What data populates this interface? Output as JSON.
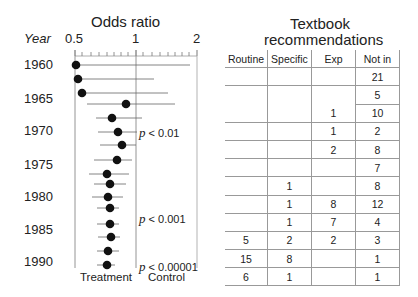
{
  "forest": {
    "title": "Odds ratio",
    "year_header": "Year",
    "axis_ticks": [
      "0.5",
      "1",
      "2"
    ],
    "year_labels": [
      "1960",
      "1965",
      "1970",
      "1975",
      "1980",
      "1985",
      "1990"
    ],
    "pvalues": [
      "p < 0.01",
      "p < 0.001",
      "p < 0.00001"
    ],
    "footer_left": "Treatment",
    "footer_right": "Control"
  },
  "table": {
    "title_line1": "Textbook",
    "title_line2": "recommendations",
    "columns": [
      "Routine",
      "Specific",
      "Exp",
      "Not in"
    ],
    "rows": [
      [
        "",
        "",
        "",
        "21"
      ],
      [
        "",
        "",
        "",
        "5"
      ],
      [
        "",
        "",
        "1",
        "10"
      ],
      [
        "",
        "",
        "1",
        "2"
      ],
      [
        "",
        "",
        "2",
        "8"
      ],
      [
        "",
        "",
        "",
        "7"
      ],
      [
        "",
        "1",
        "",
        "8"
      ],
      [
        "",
        "1",
        "8",
        "12"
      ],
      [
        "",
        "1",
        "7",
        "4"
      ],
      [
        "5",
        "2",
        "2",
        "3"
      ],
      [
        "15",
        "8",
        "",
        "1"
      ],
      [
        "6",
        "1",
        "",
        "1"
      ]
    ]
  },
  "chart_data": [
    {
      "type": "scatter",
      "title": "Odds ratio",
      "subtype": "forest plot (cumulative meta-analysis), log x-axis",
      "xlabel": "Odds ratio",
      "ylabel": "Year",
      "x_scale": "log",
      "xlim": [
        0.5,
        2
      ],
      "x_ticks": [
        0.5,
        1,
        2
      ],
      "y_tick_labels": [
        "1960",
        "1965",
        "1970",
        "1975",
        "1980",
        "1985",
        "1990"
      ],
      "reference_line": 1,
      "x_direction_labels": {
        "left": "Treatment",
        "right": "Control"
      },
      "annotations": [
        "p < 0.01",
        "p < 0.001",
        "p < 0.00001"
      ],
      "points": [
        {
          "row": 1,
          "or": 0.5,
          "ci_low": 0.5,
          "ci_high": 1.85
        },
        {
          "row": 2,
          "or": 0.51,
          "ci_low": 0.5,
          "ci_high": 1.24
        },
        {
          "row": 3,
          "or": 0.53,
          "ci_low": 0.5,
          "ci_high": 1.45
        },
        {
          "row": 4,
          "or": 0.89,
          "ci_low": 0.57,
          "ci_high": 1.55
        },
        {
          "row": 5,
          "or": 0.76,
          "ci_low": 0.64,
          "ci_high": 1.07
        },
        {
          "row": 6,
          "or": 0.81,
          "ci_low": 0.66,
          "ci_high": 1.03
        },
        {
          "row": 7,
          "or": 0.84,
          "ci_low": 0.68,
          "ci_high": 1.01
        },
        {
          "row": 8,
          "or": 0.8,
          "ci_low": 0.62,
          "ci_high": 0.96
        },
        {
          "row": 9,
          "or": 0.72,
          "ci_low": 0.59,
          "ci_high": 0.92
        },
        {
          "row": 10,
          "or": 0.74,
          "ci_low": 0.62,
          "ci_high": 0.89
        },
        {
          "row": 11,
          "or": 0.73,
          "ci_low": 0.61,
          "ci_high": 0.87
        },
        {
          "row": 12,
          "or": 0.74,
          "ci_low": 0.65,
          "ci_high": 0.84
        },
        {
          "row": 13,
          "or": 0.74,
          "ci_low": 0.65,
          "ci_high": 0.84
        },
        {
          "row": 14,
          "or": 0.75,
          "ci_low": 0.66,
          "ci_high": 0.85
        },
        {
          "row": 15,
          "or": 0.73,
          "ci_low": 0.65,
          "ci_high": 0.84
        },
        {
          "row": 16,
          "or": 0.72,
          "ci_low": 0.65,
          "ci_high": 0.81
        }
      ]
    },
    {
      "type": "table",
      "title": "Textbook recommendations",
      "columns": [
        "Routine",
        "Specific",
        "Exp",
        "Not in"
      ],
      "rows": [
        [
          null,
          null,
          null,
          21
        ],
        [
          null,
          null,
          null,
          5
        ],
        [
          null,
          null,
          1,
          10
        ],
        [
          null,
          null,
          1,
          2
        ],
        [
          null,
          null,
          2,
          8
        ],
        [
          null,
          null,
          null,
          7
        ],
        [
          null,
          1,
          null,
          8
        ],
        [
          null,
          1,
          8,
          12
        ],
        [
          null,
          1,
          7,
          4
        ],
        [
          5,
          2,
          2,
          3
        ],
        [
          15,
          8,
          null,
          1
        ],
        [
          6,
          1,
          null,
          1
        ]
      ]
    }
  ]
}
